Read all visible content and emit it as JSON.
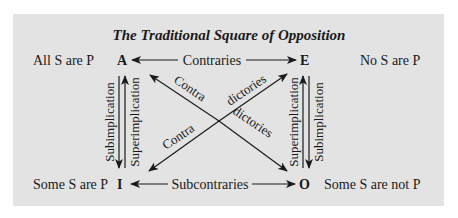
{
  "title": "The Traditional Square of Opposition",
  "corners": {
    "A": {
      "letter": "A",
      "statement": "All S are P"
    },
    "E": {
      "letter": "E",
      "statement": "No S are P"
    },
    "I": {
      "letter": "I",
      "statement": "Some S are P"
    },
    "O": {
      "letter": "O",
      "statement": "Some S are not P"
    }
  },
  "relations": {
    "top": "Contraries",
    "bottom": "Subcontraries",
    "diag_a_o_part1": "Contra",
    "diag_a_o_part2": "dictories",
    "diag_i_e_part1": "Contra",
    "diag_i_e_part2": "dictories",
    "left_down": "Subimplication",
    "left_up": "Superimplication",
    "right_up": "Superimplication",
    "right_down": "Subimplication"
  },
  "colors": {
    "panel": "#e3e3e3",
    "ink": "#1a1a1a",
    "background": "#ffffff"
  }
}
